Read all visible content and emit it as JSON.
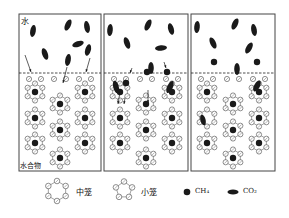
{
  "panels": [
    {
      "x": 19,
      "y": 14,
      "w": 82,
      "h": 157
    },
    {
      "x": 104,
      "y": 14,
      "w": 84,
      "h": 157
    },
    {
      "x": 191,
      "y": 14,
      "w": 84,
      "h": 157
    }
  ],
  "dashed_line_y": 73,
  "labels": {
    "water": "水",
    "hydrate": "水合物"
  },
  "legend": {
    "medium_cage": "中笼",
    "small_cage": "小笼",
    "ch4": "CH₄",
    "co2": "CO₂"
  },
  "colors": {
    "stroke": "#444444",
    "molecule": "#1a1a1a"
  }
}
